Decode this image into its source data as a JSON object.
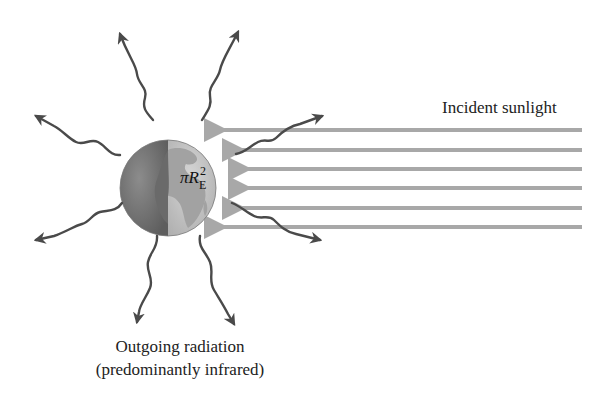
{
  "labels": {
    "incident": "Incident sunlight",
    "outgoing_line1": "Outgoing radiation",
    "outgoing_line2": "(predominantly infrared)",
    "area_symbol": "πR",
    "area_superscript": "2",
    "area_subscript": "E"
  },
  "earth": {
    "center": [
      168,
      188
    ],
    "radius": 48,
    "dark_color": "#7a7a7a",
    "light_color": "#c4c4c4",
    "land_color": "#9a9a9a"
  },
  "incident_arrows": {
    "color": "#a8a8a8",
    "count": 6,
    "y_positions": [
      130,
      150,
      169,
      188,
      208,
      227
    ],
    "x_start": 582,
    "x_ends": [
      214,
      232,
      232,
      232,
      232,
      214
    ]
  },
  "outgoing_arrows": {
    "color": "#555555",
    "count": 10,
    "directions": [
      "up-left",
      "up-right",
      "left-upper",
      "left-lower",
      "down-left",
      "down-right",
      "right-upper",
      "right-lower"
    ]
  }
}
